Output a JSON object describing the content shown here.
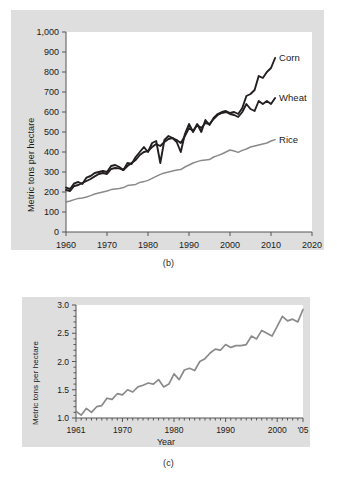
{
  "figure": {
    "background_color": "#ffffff",
    "panel_color": "#dedede",
    "plot_color": "#ffffff"
  },
  "panel_b": {
    "caption": "(b)",
    "chart_data": {
      "type": "line",
      "title": "",
      "subtitle": "",
      "xlabel": "",
      "ylabel": "Metric tons per hectare",
      "xlim": [
        1960,
        2020
      ],
      "ylim": [
        0,
        1000
      ],
      "xticks": [
        1960,
        1970,
        1980,
        1990,
        2000,
        2010,
        2020
      ],
      "xtick_labels": [
        "1960",
        "1970",
        "1980",
        "1990",
        "2000",
        "2010",
        "2020"
      ],
      "yticks": [
        0,
        100,
        200,
        300,
        400,
        500,
        600,
        700,
        800,
        900,
        1000
      ],
      "ytick_labels": [
        "0",
        "100",
        "200",
        "300",
        "400",
        "500",
        "600",
        "700",
        "800",
        "900",
        "1,000"
      ],
      "grid": false,
      "legend_position": "right-of-line-ends",
      "x": [
        1960,
        1961,
        1962,
        1963,
        1964,
        1965,
        1966,
        1967,
        1968,
        1969,
        1970,
        1971,
        1972,
        1973,
        1974,
        1975,
        1976,
        1977,
        1978,
        1979,
        1980,
        1981,
        1982,
        1983,
        1984,
        1985,
        1986,
        1987,
        1988,
        1989,
        1990,
        1991,
        1992,
        1993,
        1994,
        1995,
        1996,
        1997,
        1998,
        1999,
        2000,
        2001,
        2002,
        2003,
        2004,
        2005,
        2006,
        2007,
        2008,
        2009,
        2010,
        2011
      ],
      "series": [
        {
          "name": "Corn",
          "color": "#231f20",
          "values": [
            222,
            215,
            243,
            250,
            240,
            272,
            280,
            295,
            300,
            305,
            300,
            330,
            335,
            325,
            310,
            345,
            340,
            375,
            400,
            425,
            400,
            445,
            455,
            345,
            460,
            480,
            470,
            450,
            400,
            490,
            540,
            500,
            540,
            500,
            560,
            535,
            570,
            590,
            600,
            605,
            595,
            600,
            590,
            620,
            680,
            690,
            710,
            780,
            770,
            800,
            820,
            870
          ]
        },
        {
          "name": "Wheat",
          "color": "#231f20",
          "values": [
            210,
            205,
            230,
            235,
            245,
            255,
            265,
            278,
            290,
            295,
            290,
            315,
            320,
            318,
            310,
            330,
            345,
            360,
            385,
            400,
            405,
            425,
            440,
            430,
            450,
            465,
            470,
            460,
            445,
            480,
            520,
            505,
            535,
            520,
            545,
            540,
            565,
            585,
            595,
            600,
            590,
            585,
            575,
            600,
            640,
            615,
            605,
            655,
            640,
            655,
            640,
            670
          ]
        },
        {
          "name": "Rice",
          "color": "#8a8a8a",
          "values": [
            150,
            155,
            162,
            168,
            170,
            175,
            182,
            190,
            195,
            200,
            205,
            212,
            215,
            218,
            222,
            232,
            235,
            238,
            248,
            252,
            258,
            268,
            278,
            288,
            295,
            300,
            305,
            310,
            312,
            325,
            335,
            345,
            352,
            358,
            360,
            362,
            375,
            382,
            390,
            400,
            410,
            405,
            398,
            408,
            415,
            425,
            430,
            435,
            440,
            445,
            455,
            462
          ]
        }
      ]
    }
  },
  "panel_c": {
    "caption": "(c)",
    "chart_data": {
      "type": "line",
      "title": "",
      "xlabel": "Year",
      "ylabel": "Metric tons per hectare",
      "xlim": [
        1961,
        2005
      ],
      "ylim": [
        1.0,
        3.0
      ],
      "xticks": [
        1961,
        1970,
        1980,
        1990,
        2000,
        2005
      ],
      "xtick_labels": [
        "1961",
        "1970",
        "1980",
        "1990",
        "2000",
        "'05"
      ],
      "yticks": [
        1.0,
        1.5,
        2.0,
        2.5,
        3.0
      ],
      "ytick_labels": [
        "1.0",
        "1.5",
        "2.0",
        "2.5",
        "3.0"
      ],
      "grid": false,
      "minor_ticks": true,
      "x": [
        1961,
        1962,
        1963,
        1964,
        1965,
        1966,
        1967,
        1968,
        1969,
        1970,
        1971,
        1972,
        1973,
        1974,
        1975,
        1976,
        1977,
        1978,
        1979,
        1980,
        1981,
        1982,
        1983,
        1984,
        1985,
        1986,
        1987,
        1988,
        1989,
        1990,
        1991,
        1992,
        1993,
        1994,
        1995,
        1996,
        1997,
        1998,
        1999,
        2000,
        2001,
        2002,
        2003,
        2004,
        2005
      ],
      "series": [
        {
          "name": "yield",
          "color": "#8a8a8a",
          "values": [
            1.12,
            1.05,
            1.17,
            1.1,
            1.2,
            1.22,
            1.35,
            1.33,
            1.43,
            1.41,
            1.5,
            1.46,
            1.55,
            1.58,
            1.62,
            1.6,
            1.68,
            1.55,
            1.6,
            1.78,
            1.68,
            1.85,
            1.88,
            1.84,
            2.0,
            2.05,
            2.15,
            2.22,
            2.2,
            2.3,
            2.25,
            2.28,
            2.28,
            2.3,
            2.45,
            2.4,
            2.55,
            2.5,
            2.45,
            2.62,
            2.8,
            2.72,
            2.75,
            2.7,
            2.92
          ]
        }
      ]
    }
  }
}
